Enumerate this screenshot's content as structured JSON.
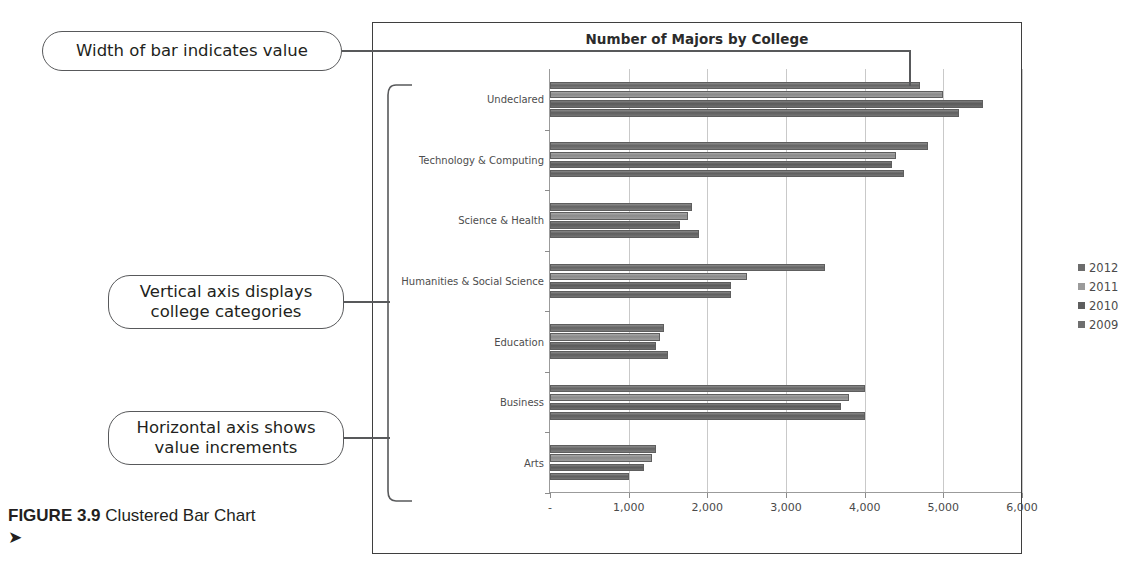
{
  "figure": {
    "label": "FIGURE 3.9",
    "caption": "Clustered Bar Chart ➤"
  },
  "callouts": [
    {
      "name": "width-of-bar",
      "text": "Width of bar indicates value"
    },
    {
      "name": "vertical-axis",
      "text": "Vertical axis displays\ncollege categories"
    },
    {
      "name": "horizontal-axis",
      "text": "Horizontal axis shows\nvalue increments"
    }
  ],
  "legend": {
    "position": "right",
    "entries": [
      {
        "label": "2012",
        "color": "#6c6c6c"
      },
      {
        "label": "2011",
        "color": "#9b9b9b"
      },
      {
        "label": "2010",
        "color": "#5e5e5e"
      },
      {
        "label": "2009",
        "color": "#6f6f6f"
      }
    ]
  },
  "chart_data": {
    "type": "bar",
    "orientation": "horizontal",
    "title": "Number of Majors by College",
    "xlabel": "",
    "ylabel": "",
    "xlim": [
      0,
      6000
    ],
    "grid": true,
    "xticks": [
      0,
      1000,
      2000,
      3000,
      4000,
      5000,
      6000
    ],
    "xticklabels": [
      "-",
      "1,000",
      "2,000",
      "3,000",
      "4,000",
      "5,000",
      "6,000"
    ],
    "categories": [
      "Undeclared",
      "Technology & Computing",
      "Science & Health",
      "Humanities & Social Science",
      "Education",
      "Business",
      "Arts"
    ],
    "series": [
      {
        "name": "2012",
        "color": "#6c6c6c",
        "values": [
          4700,
          4800,
          1800,
          3500,
          1450,
          4000,
          1350
        ]
      },
      {
        "name": "2011",
        "color": "#9b9b9b",
        "values": [
          5000,
          4400,
          1750,
          2500,
          1400,
          3800,
          1300
        ]
      },
      {
        "name": "2010",
        "color": "#5e5e5e",
        "values": [
          5500,
          4350,
          1650,
          2300,
          1350,
          3700,
          1200
        ]
      },
      {
        "name": "2009",
        "color": "#6f6f6f",
        "values": [
          5200,
          4500,
          1900,
          2300,
          1500,
          4000,
          1000
        ]
      }
    ]
  }
}
